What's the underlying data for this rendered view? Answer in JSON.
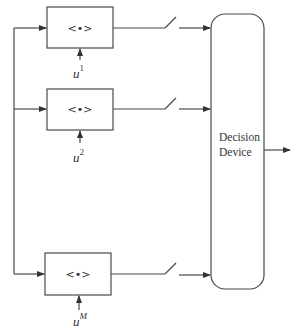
{
  "diagram": {
    "title": "",
    "branches": [
      {
        "id": 1,
        "operator_label": "<•>",
        "input_base": "u",
        "input_sup": "1",
        "sup_italic": false
      },
      {
        "id": 2,
        "operator_label": "<•>",
        "input_base": "u",
        "input_sup": "2",
        "sup_italic": false
      },
      {
        "id": 3,
        "operator_label": "<•>",
        "input_base": "u",
        "input_sup": "M",
        "sup_italic": true
      }
    ],
    "decision_device": {
      "line1": "Decision",
      "line2": "Device"
    },
    "components": {
      "switch": "switch-icon",
      "arrow": "arrow-icon",
      "output": "output-arrow"
    },
    "colors": {
      "line": "#4a4a4a",
      "text": "#333333",
      "background": "#ffffff"
    }
  }
}
